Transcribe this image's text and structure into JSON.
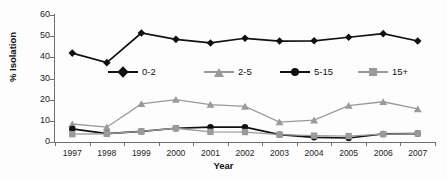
{
  "chart_data": {
    "type": "line",
    "title": "",
    "xlabel": "Year",
    "ylabel": "% Isolation",
    "categories": [
      "1997",
      "1998",
      "1999",
      "2000",
      "2001",
      "2002",
      "2003",
      "2004",
      "2005",
      "2006",
      "2007"
    ],
    "x": [
      1997,
      1998,
      1999,
      2000,
      2001,
      2002,
      2003,
      2004,
      2005,
      2006,
      2007
    ],
    "ylim": [
      0,
      60
    ],
    "yticks": [
      0,
      10,
      20,
      30,
      40,
      50,
      60
    ],
    "ytick_labels": [
      "0",
      "10",
      "20",
      "30",
      "40",
      "50",
      "60"
    ],
    "grid": false,
    "legend_position": "inside-upper-center",
    "series": [
      {
        "name": "0-2",
        "marker": "diamond",
        "color": "#111111",
        "values": [
          42.0,
          37.5,
          51.5,
          48.5,
          46.8,
          49.0,
          47.7,
          47.8,
          49.5,
          51.2,
          47.7
        ]
      },
      {
        "name": "2-5",
        "marker": "triangle",
        "color": "#9a9a9a",
        "values": [
          8.5,
          7.0,
          18.0,
          20.0,
          17.7,
          16.8,
          9.4,
          10.3,
          17.2,
          19.0,
          15.6
        ]
      },
      {
        "name": "5-15",
        "marker": "circle",
        "color": "#111111",
        "values": [
          6.2,
          4.0,
          5.0,
          6.5,
          7.0,
          7.0,
          3.5,
          2.2,
          1.9,
          3.8,
          4.0
        ]
      },
      {
        "name": "15+",
        "marker": "square",
        "color": "#9a9a9a",
        "values": [
          3.7,
          3.9,
          5.0,
          6.5,
          4.8,
          4.7,
          3.5,
          3.0,
          2.8,
          3.7,
          4.0
        ]
      }
    ]
  },
  "colors": {
    "series_dark": "#111111",
    "series_gray": "#9a9a9a",
    "axis": "#6f6f6f",
    "background": "#fdfdfd",
    "text": "#1a1a1a"
  }
}
